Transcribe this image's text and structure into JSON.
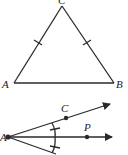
{
  "figures": {
    "triangle": {
      "description": "Isosceles triangle ABC with congruent sides AC and BC",
      "labels": {
        "apex": "C",
        "left": "A",
        "right": "B"
      },
      "congruent_marks": [
        "AC",
        "BC"
      ]
    },
    "angle_bisector": {
      "description": "Angle bisector construction from vertex A with rays through C and P",
      "labels": {
        "vertex": "A",
        "upper_point": "C",
        "ray_point": "P"
      },
      "congruent_angle_marks": 2
    }
  },
  "colors": {
    "stroke": "#2a2a2a",
    "background": "#ffffff"
  }
}
